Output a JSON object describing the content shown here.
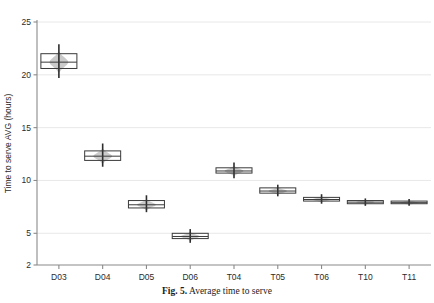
{
  "caption": {
    "label": "Fig. 5.",
    "text": "Average time to serve"
  },
  "colors": {
    "axis": "#8a8a8a",
    "grid": "#e2e2e2",
    "box_stroke": "#3a3a3a",
    "violin_fill": "#9e9e9e",
    "whisker": "#2e2e2e",
    "text": "#2b2b2b"
  },
  "chart_data": {
    "type": "box",
    "title": "",
    "xlabel": "",
    "ylabel": "Time to serve AVG  (hours)",
    "ylim": [
      2,
      25
    ],
    "yticks": [
      2,
      5,
      10,
      15,
      20,
      25
    ],
    "ytick_labels": [
      "2",
      "5",
      "10",
      "15",
      "20",
      "25"
    ],
    "grid": true,
    "legend": "none",
    "categories": [
      "D03",
      "D04",
      "D05",
      "D06",
      "T04",
      "T05",
      "T06",
      "T10",
      "T11"
    ],
    "boxes": [
      {
        "category": "D03",
        "min": 19.7,
        "q1": 20.6,
        "median": 21.2,
        "q3": 22.0,
        "max": 22.9,
        "spread": 1.35
      },
      {
        "category": "D04",
        "min": 11.3,
        "q1": 11.9,
        "median": 12.3,
        "q3": 12.8,
        "max": 13.5,
        "spread": 1.0
      },
      {
        "category": "D05",
        "min": 7.0,
        "q1": 7.4,
        "median": 7.7,
        "q3": 8.1,
        "max": 8.6,
        "spread": 0.8
      },
      {
        "category": "D06",
        "min": 4.1,
        "q1": 4.5,
        "median": 4.7,
        "q3": 5.0,
        "max": 5.4,
        "spread": 0.65
      },
      {
        "category": "T04",
        "min": 10.2,
        "q1": 10.7,
        "median": 10.9,
        "q3": 11.2,
        "max": 11.7,
        "spread": 0.75
      },
      {
        "category": "T05",
        "min": 8.5,
        "q1": 8.8,
        "median": 9.0,
        "q3": 9.3,
        "max": 9.6,
        "spread": 0.55
      },
      {
        "category": "T06",
        "min": 7.8,
        "q1": 8.05,
        "median": 8.2,
        "q3": 8.4,
        "max": 8.7,
        "spread": 0.45
      },
      {
        "category": "T10",
        "min": 7.6,
        "q1": 7.8,
        "median": 7.95,
        "q3": 8.1,
        "max": 8.3,
        "spread": 0.35
      },
      {
        "category": "T11",
        "min": 7.6,
        "q1": 7.8,
        "median": 7.9,
        "q3": 8.05,
        "max": 8.25,
        "spread": 0.32
      }
    ],
    "values": [
      21.2,
      12.3,
      7.7,
      4.7,
      10.9,
      9.0,
      8.2,
      7.95,
      7.9
    ]
  }
}
